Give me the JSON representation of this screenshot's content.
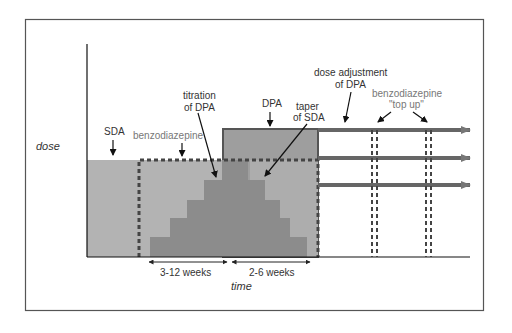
{
  "diagram": {
    "y_axis_label": "dose",
    "x_axis_label": "time",
    "labels": {
      "sda": "SDA",
      "benzodiazepine": "benzodiazepine",
      "titration_line1": "titration",
      "titration_line2": "of DPA",
      "dpa": "DPA",
      "taper_line1": "taper",
      "taper_line2": "of SDA",
      "dose_adjustment_line1": "dose adjustment",
      "dose_adjustment_line2": "of DPA",
      "benzo_topup_line1": "benzodiazepine",
      "benzo_topup_line2": "\"top up\""
    },
    "durations": {
      "titration_period": "3-12 weeks",
      "taper_period": "2-6 weeks"
    },
    "colors": {
      "sda_fill": "#b3b3b3",
      "dpa_titration_fill": "#8c8c8c",
      "dpa_block_fill": "#9e9e9e",
      "sda_taper_fill": "#adadad",
      "benzodiazepine_dash": "#444444",
      "dpa_arrow": "#666666",
      "frame": "#555555"
    }
  }
}
